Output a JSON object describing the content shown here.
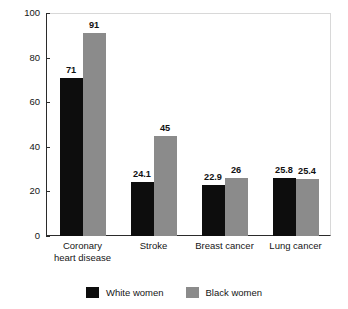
{
  "chart_data": {
    "type": "bar",
    "title": "",
    "subtitle": "",
    "xlabel": "",
    "ylabel": "Deaths per 100,000",
    "ylim": [
      0,
      100
    ],
    "yticks": [
      0,
      20,
      40,
      60,
      80,
      100
    ],
    "ytick_labels": [
      "0",
      "20",
      "40",
      "60",
      "80",
      "100"
    ],
    "grid": false,
    "legend_position": "bottom-center",
    "categories": [
      "Coronary\nheart disease",
      "Stroke",
      "Breast cancer",
      "Lung cancer"
    ],
    "category_labels_flat": [
      "Coronary heart disease",
      "Stroke",
      "Breast cancer",
      "Lung cancer"
    ],
    "series": [
      {
        "name": "White women",
        "color": "#0d0d0d",
        "values": [
          71,
          24.1,
          22.9,
          25.8
        ],
        "value_labels": [
          "71",
          "24.1",
          "22.9",
          "25.8"
        ]
      },
      {
        "name": "Black women",
        "color": "#8b8b8b",
        "values": [
          91,
          45,
          26,
          25.4
        ],
        "value_labels": [
          "91",
          "45",
          "26",
          "25.4"
        ]
      }
    ]
  },
  "legend": {
    "entries": [
      {
        "label": "White women",
        "swatch": "white-women"
      },
      {
        "label": "Black women",
        "swatch": "black-women"
      }
    ]
  }
}
